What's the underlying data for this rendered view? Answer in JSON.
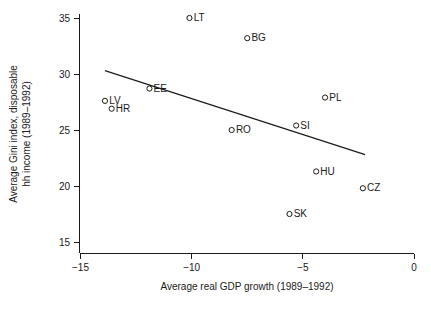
{
  "chart_data": {
    "type": "scatter",
    "title": "",
    "xlabel": "Average real GDP growth (1989–1992)",
    "ylabel": "Average Gini index, disposable hh income (1989–1992)",
    "ylabel_line1": "Average Gini index, disposable",
    "ylabel_line2": "hh income (1989–1992)",
    "xlim": [
      -15,
      0
    ],
    "ylim": [
      15,
      35
    ],
    "xticks": [
      -15,
      -10,
      -5,
      0
    ],
    "xtick_labels": [
      "−15",
      "−10",
      "−5",
      "0"
    ],
    "yticks": [
      15,
      20,
      25,
      30,
      35
    ],
    "ytick_labels": [
      "15",
      "20",
      "25",
      "30",
      "35"
    ],
    "grid": false,
    "legend": "none",
    "marker_style": "open-circle",
    "series": [
      {
        "name": "Countries",
        "points": [
          {
            "label": "LT",
            "x": -10.1,
            "y": 35.0
          },
          {
            "label": "BG",
            "x": -7.5,
            "y": 33.2
          },
          {
            "label": "EE",
            "x": -11.9,
            "y": 28.7
          },
          {
            "label": "LV",
            "x": -13.9,
            "y": 27.6
          },
          {
            "label": "HR",
            "x": -13.6,
            "y": 26.9
          },
          {
            "label": "PL",
            "x": -4.0,
            "y": 27.9
          },
          {
            "label": "RO",
            "x": -8.2,
            "y": 25.0
          },
          {
            "label": "SI",
            "x": -5.3,
            "y": 25.4
          },
          {
            "label": "HU",
            "x": -4.4,
            "y": 21.3
          },
          {
            "label": "CZ",
            "x": -2.3,
            "y": 19.8
          },
          {
            "label": "SK",
            "x": -5.6,
            "y": 17.5
          }
        ]
      }
    ],
    "fit_line": {
      "name": "linear-fit",
      "x_start": -13.9,
      "y_start": 30.3,
      "x_end": -2.2,
      "y_end": 22.8
    },
    "colors": {
      "ink": "#1a1a1a",
      "background": "#ffffff"
    }
  }
}
